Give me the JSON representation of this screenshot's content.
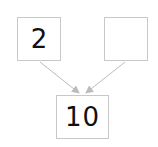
{
  "diagram": {
    "type": "number-bond",
    "parts": [
      {
        "id": "part-left",
        "value": "2"
      },
      {
        "id": "part-right",
        "value": ""
      }
    ],
    "whole": {
      "value": "10"
    },
    "colors": {
      "border": "#c8c8c8",
      "arrow": "#bbbbbb",
      "text": "#111111"
    }
  }
}
